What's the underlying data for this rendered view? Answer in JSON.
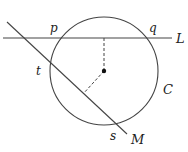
{
  "diagram": {
    "type": "geometry",
    "colors": {
      "stroke": "#444444",
      "background": "#ffffff"
    },
    "labels": {
      "p": "p",
      "q": "q",
      "L": "L",
      "t": "t",
      "C": "C",
      "s": "s",
      "M": "M"
    },
    "circle": {
      "name": "C",
      "cx": 104,
      "cy": 71,
      "r": 54
    },
    "lines": [
      {
        "name": "L",
        "from": [
          3,
          38
        ],
        "to": [
          172,
          38
        ]
      },
      {
        "name": "M",
        "from": [
          7,
          22
        ],
        "to": [
          127,
          134
        ]
      }
    ],
    "dashed": [
      {
        "from": [
          104,
          71
        ],
        "to": [
          104,
          38
        ]
      },
      {
        "from": [
          104,
          71
        ],
        "to": [
          83,
          94
        ]
      }
    ]
  }
}
